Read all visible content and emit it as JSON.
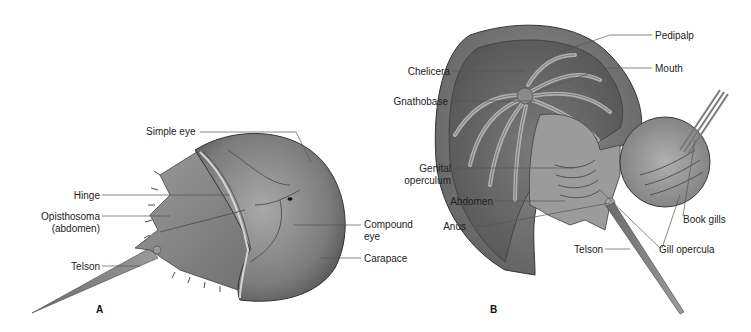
{
  "figure": {
    "panels": [
      {
        "id": "A",
        "label": "A",
        "view": "dorsal",
        "labels": {
          "simple_eye": "Simple eye",
          "hinge": "Hinge",
          "opisthosoma_line1": "Opisthosoma",
          "opisthosoma_line2": "(abdomen)",
          "telson": "Telson",
          "compound_eye_line1": "Compound",
          "compound_eye_line2": "eye",
          "carapace": "Carapace"
        }
      },
      {
        "id": "B",
        "label": "B",
        "view": "ventral",
        "labels": {
          "pedipalp": "Pedipalp",
          "chelicera": "Chelicera",
          "mouth": "Mouth",
          "gnathobase": "Gnathobase",
          "genital_operculum_line1": "Genital",
          "genital_operculum_line2": "operculum",
          "abdomen": "Abdomen",
          "anus": "Anus",
          "book_gills": "Book gills",
          "telson": "Telson",
          "gill_opercula": "Gill opercula"
        }
      }
    ],
    "colors": {
      "body_dark": "#5a5a5a",
      "body_mid": "#8a8a8a",
      "body_light": "#bdbdbd",
      "leader_line": "#555555",
      "text": "#222222"
    }
  }
}
